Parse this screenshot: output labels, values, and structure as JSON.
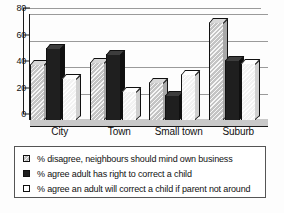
{
  "chart_data": {
    "type": "bar",
    "title": "",
    "xlabel": "",
    "ylabel": "",
    "ylim": [
      0,
      80
    ],
    "yticks": [
      0,
      20,
      40,
      60,
      80
    ],
    "grid": true,
    "legend_position": "bottom",
    "categories": [
      "City",
      "Town",
      "Small town",
      "Suburb"
    ],
    "series": [
      {
        "name": "% disagree, neighbours should mind own business",
        "color": "#c4c4c4",
        "values": [
          42,
          44,
          29,
          74
        ]
      },
      {
        "name": "% agree adult has right to correct a child",
        "color": "#1f1f1f",
        "values": [
          54,
          50,
          19,
          45
        ]
      },
      {
        "name": "% agree an adult will correct a child if parent not around",
        "color": "#ffffff",
        "values": [
          32,
          22,
          35,
          43
        ]
      }
    ]
  }
}
